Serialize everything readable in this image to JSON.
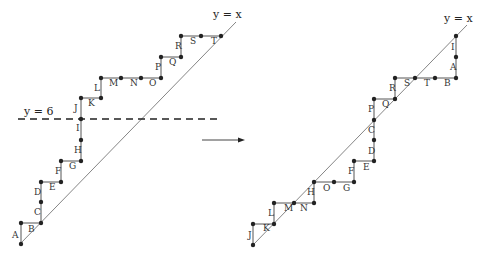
{
  "left": {
    "diagonal_label": "y = x",
    "diagonal": [
      20,
      244,
      236,
      22
    ],
    "dashed_label": "y = 6",
    "dashed": [
      18,
      119,
      220,
      119
    ],
    "points": [
      [
        21,
        244
      ],
      [
        21,
        223
      ],
      [
        41,
        223
      ],
      [
        41,
        202
      ],
      [
        41,
        182
      ],
      [
        61,
        182
      ],
      [
        61,
        161
      ],
      [
        81,
        161
      ],
      [
        81,
        140
      ],
      [
        81,
        119
      ],
      [
        81,
        98
      ],
      [
        101,
        98
      ],
      [
        101,
        78
      ],
      [
        121,
        78
      ],
      [
        141,
        78
      ],
      [
        161,
        78
      ],
      [
        161,
        57
      ],
      [
        181,
        57
      ],
      [
        181,
        36
      ],
      [
        201,
        36
      ],
      [
        221,
        36
      ]
    ],
    "labels": [
      {
        "t": "A",
        "x": 12,
        "y": 238
      },
      {
        "t": "B",
        "x": 28,
        "y": 232
      },
      {
        "t": "C",
        "x": 34,
        "y": 215
      },
      {
        "t": "D",
        "x": 34,
        "y": 195
      },
      {
        "t": "E",
        "x": 49,
        "y": 190
      },
      {
        "t": "F",
        "x": 55,
        "y": 174
      },
      {
        "t": "G",
        "x": 69,
        "y": 169
      },
      {
        "t": "H",
        "x": 74,
        "y": 153
      },
      {
        "t": "I",
        "x": 76,
        "y": 131
      },
      {
        "t": "J",
        "x": 74,
        "y": 111
      },
      {
        "t": "K",
        "x": 88,
        "y": 106
      },
      {
        "t": "L",
        "x": 94,
        "y": 91
      },
      {
        "t": "M",
        "x": 109,
        "y": 86
      },
      {
        "t": "N",
        "x": 130,
        "y": 86
      },
      {
        "t": "O",
        "x": 149,
        "y": 86
      },
      {
        "t": "P",
        "x": 155,
        "y": 70
      },
      {
        "t": "Q",
        "x": 169,
        "y": 65
      },
      {
        "t": "R",
        "x": 175,
        "y": 49
      },
      {
        "t": "S",
        "x": 190,
        "y": 44
      },
      {
        "t": "T",
        "x": 211,
        "y": 44
      }
    ]
  },
  "right": {
    "diagonal_label": "y = x",
    "diagonal": [
      253,
      245,
      467,
      25
    ],
    "points": [
      [
        253,
        245
      ],
      [
        253,
        224
      ],
      [
        274,
        224
      ],
      [
        274,
        203
      ],
      [
        294,
        203
      ],
      [
        314,
        203
      ],
      [
        314,
        182
      ],
      [
        334,
        182
      ],
      [
        354,
        182
      ],
      [
        354,
        161
      ],
      [
        374,
        161
      ],
      [
        374,
        140
      ],
      [
        374,
        120
      ],
      [
        374,
        99
      ],
      [
        395,
        99
      ],
      [
        395,
        78
      ],
      [
        415,
        78
      ],
      [
        435,
        78
      ],
      [
        456,
        78
      ],
      [
        456,
        57
      ],
      [
        456,
        36
      ]
    ],
    "labels": [
      {
        "t": "J",
        "x": 248,
        "y": 238
      },
      {
        "t": "K",
        "x": 263,
        "y": 231
      },
      {
        "t": "L",
        "x": 268,
        "y": 216
      },
      {
        "t": "M",
        "x": 284,
        "y": 211
      },
      {
        "t": "N",
        "x": 300,
        "y": 211
      },
      {
        "t": "H",
        "x": 307,
        "y": 195
      },
      {
        "t": "O",
        "x": 323,
        "y": 191
      },
      {
        "t": "G",
        "x": 343,
        "y": 191
      },
      {
        "t": "F",
        "x": 348,
        "y": 174
      },
      {
        "t": "E",
        "x": 363,
        "y": 170
      },
      {
        "t": "D",
        "x": 368,
        "y": 154
      },
      {
        "t": "C",
        "x": 368,
        "y": 133
      },
      {
        "t": "P",
        "x": 368,
        "y": 112
      },
      {
        "t": "Q",
        "x": 382,
        "y": 107
      },
      {
        "t": "R",
        "x": 389,
        "y": 91
      },
      {
        "t": "S",
        "x": 404,
        "y": 86
      },
      {
        "t": "T",
        "x": 424,
        "y": 86
      },
      {
        "t": "B",
        "x": 444,
        "y": 86
      },
      {
        "t": "A",
        "x": 450,
        "y": 70
      },
      {
        "t": "I",
        "x": 451,
        "y": 50
      }
    ]
  },
  "arrow": [
    202,
    140,
    245,
    140
  ]
}
